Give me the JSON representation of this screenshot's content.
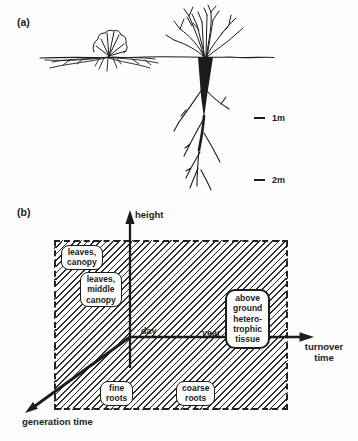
{
  "figure": {
    "colors": {
      "ink": "#1c1c1c",
      "paper": "#fdfdfd",
      "hatch_line": "#2e2e2e"
    },
    "panel_a": {
      "label": "(a)",
      "scale_markers": [
        {
          "label": "1m"
        },
        {
          "label": "2m"
        }
      ]
    },
    "panel_b": {
      "label": "(b)",
      "axes": {
        "height_label": "height",
        "turnover_label": "turnover\ntime",
        "generation_label": "generation time",
        "tick_day": "day",
        "tick_year": "year"
      },
      "boxes": [
        {
          "label": "leaves,\ncanopy"
        },
        {
          "label": "leaves,\nmiddle\ncanopy"
        },
        {
          "label": "above\nground\nhetero-\ntrophic\ntissue"
        },
        {
          "label": "fine\nroots"
        },
        {
          "label": "coarse\nroots"
        }
      ]
    }
  }
}
